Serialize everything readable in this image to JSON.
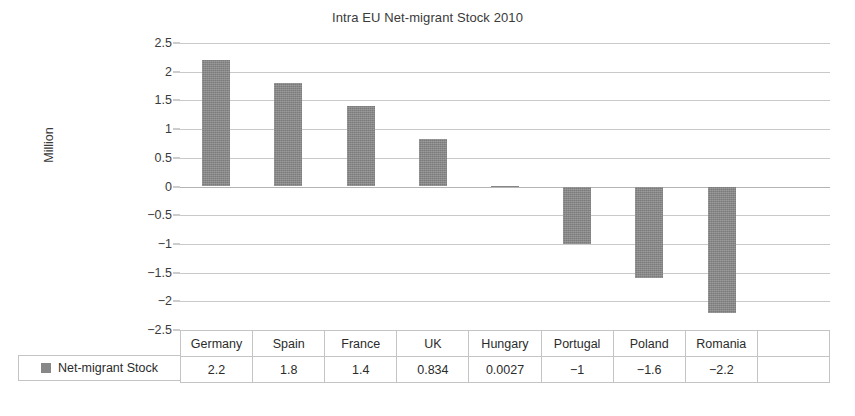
{
  "chart_data": {
    "type": "bar",
    "title": "Intra EU Net-migrant Stock 2010",
    "xlabel": "",
    "ylabel": "Million",
    "categories": [
      "Germany",
      "Spain",
      "France",
      "UK",
      "Hungary",
      "Portugal",
      "Poland",
      "Romania"
    ],
    "values": [
      2.2,
      1.8,
      1.4,
      0.834,
      0.0027,
      -1,
      -1.6,
      -2.2
    ],
    "value_labels": [
      "2.2",
      "1.8",
      "1.4",
      "0.834",
      "0.0027",
      "−1",
      "−1.6",
      "−2.2"
    ],
    "series": [
      {
        "name": "Net-migrant Stock",
        "values": [
          2.2,
          1.8,
          1.4,
          0.834,
          0.0027,
          -1,
          -1.6,
          -2.2
        ],
        "color": "#878787"
      }
    ],
    "ylim": [
      -2.5,
      2.5
    ],
    "ytick_values": [
      2.5,
      2,
      1.5,
      1,
      0.5,
      0,
      -0.5,
      -1,
      -1.5,
      -2,
      -2.5
    ],
    "ytick_labels": [
      "2.5",
      "2",
      "1.5",
      "1",
      "0.5",
      "0",
      "−0.5",
      "−1",
      "−1.5",
      "−2",
      "−2.5"
    ],
    "grid": true,
    "legend_position": "bottom-left",
    "has_data_table": true,
    "empty_trailing_column": true
  },
  "legend": {
    "marker_icon": "square-marker-icon",
    "label": "Net-migrant Stock",
    "color": "#878787"
  },
  "table": {
    "header": [
      "Germany",
      "Spain",
      "France",
      "UK",
      "Hungary",
      "Portugal",
      "Poland",
      "Romania",
      ""
    ],
    "row_label": "Net-migrant Stock",
    "row_values": [
      "2.2",
      "1.8",
      "1.4",
      "0.834",
      "0.0027",
      "−1",
      "−1.6",
      "−2.2",
      ""
    ]
  },
  "colors": {
    "bar": "#878787",
    "gridline": "#c9c9c9",
    "zeroline": "#b4b4b4",
    "table_border": "#c4c4c4",
    "text": "#2b2b2b",
    "background": "#ffffff"
  }
}
